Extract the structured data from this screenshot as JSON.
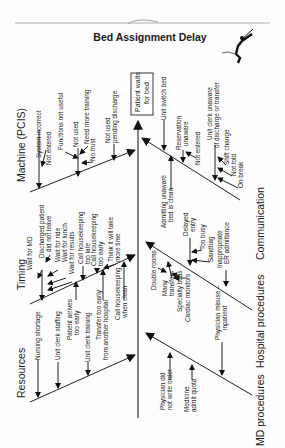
{
  "title": "Bed Assignment Delay",
  "effect": {
    "line1": "Patient waits",
    "line2": "for bed"
  },
  "categories": {
    "machine": {
      "label": "Machine (PCIS)",
      "causes": [
        {
          "l1": "System incorrect"
        },
        {
          "l1": "Not entered"
        },
        {
          "l1": "Functions not useful"
        },
        {
          "l1": "Not used"
        },
        {
          "l1": "Need more training"
        },
        {
          "l1": "No trust"
        },
        {
          "l1": "Not used",
          "l2": "pending discharge"
        }
      ]
    },
    "timing": {
      "label": "Timing",
      "causes": [
        {
          "l1": "Wait for MD"
        },
        {
          "l1": "Discharged patient",
          "l2": "did not leave"
        },
        {
          "l1": "Wait for ride"
        },
        {
          "l1": "Wait for lunch"
        },
        {
          "l1": "Wait for results"
        },
        {
          "l1": "Call housekeeping",
          "l2": "too late"
        },
        {
          "l1": "Call housekeeping",
          "l2": "too early"
        },
        {
          "l1": "Think it will take",
          "l2": "more time"
        }
      ]
    },
    "resources": {
      "label": "Resources",
      "causes": [
        {
          "l1": "Nursing shortage"
        },
        {
          "l1": "Unit clerk staffing"
        },
        {
          "l1": "Patient arrives",
          "l2": "too early"
        },
        {
          "l1": "Unit clerk training"
        },
        {
          "l1": "Transfer too early",
          "l2": "from another hospital"
        },
        {
          "l1": "Call housekeeping",
          "l2": "when clean"
        }
      ]
    },
    "communication": {
      "label": "Communication",
      "causes": [
        {
          "l1": "Unit switch bed"
        },
        {
          "l1": "Reservation",
          "l2": "unaware"
        },
        {
          "l1": "Not entered"
        },
        {
          "l1": "Unit clerk unaware",
          "l2": "of discharge or transfer"
        },
        {
          "l1": "Shift change"
        },
        {
          "l1": "Not told"
        },
        {
          "l1": "On break"
        },
        {
          "l1": "Admitting unaware",
          "l2": "bed is clean"
        }
      ]
    },
    "hospital": {
      "label": "Hospital procedures",
      "causes": [
        {
          "l1": "Delayed",
          "l2": "entry"
        },
        {
          "l1": "Too busy"
        },
        {
          "l1": "Sandbag"
        },
        {
          "l1": "Inappropriate",
          "l2": "ER admittance"
        },
        {
          "l1": "Double rooms"
        },
        {
          "l1": "Many",
          "l2": "transfers"
        },
        {
          "l1": "Specialty beds"
        },
        {
          "l1": "Cardiac monitors"
        }
      ]
    },
    "md": {
      "label": "MD procedures",
      "causes": [
        {
          "l1": "Physician misuse –",
          "l2": "inpatient"
        },
        {
          "l1": "Physician did",
          "l2": "not write order"
        },
        {
          "l1": "Medicine",
          "l2": "admit quota"
        }
      ]
    }
  }
}
